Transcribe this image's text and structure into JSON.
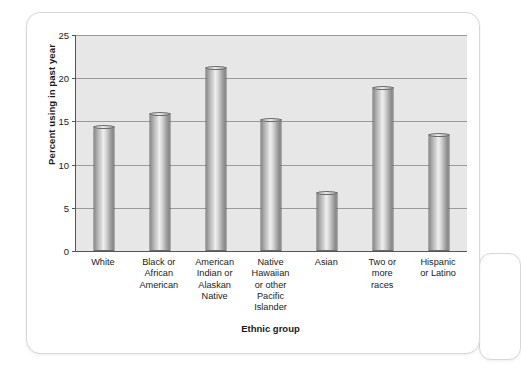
{
  "chart_data": {
    "type": "bar",
    "title": "",
    "xlabel": "Ethnic group",
    "ylabel": "Percent using in past year",
    "categories": [
      "White",
      "Black or African American",
      "American Indian or Alaskan Native",
      "Native Hawaiian or other Pacific Islander",
      "Asian",
      "Two or more races",
      "Hispanic or Latino"
    ],
    "category_lines": [
      [
        "White"
      ],
      [
        "Black or",
        "African",
        "American"
      ],
      [
        "American",
        "Indian or",
        "Alaskan",
        "Native"
      ],
      [
        "Native",
        "Hawaiian",
        "or other",
        "Pacific",
        "Islander"
      ],
      [
        "Asian"
      ],
      [
        "Two or",
        "more",
        "races"
      ],
      [
        "Hispanic",
        "or Latino"
      ]
    ],
    "values": [
      14.5,
      16.0,
      21.3,
      15.3,
      6.8,
      19.0,
      13.5
    ],
    "ylim": [
      0,
      25
    ],
    "yticks": [
      0,
      5,
      10,
      15,
      20,
      25
    ],
    "ytick_labels": [
      "0",
      "5",
      "10",
      "15",
      "20",
      "25"
    ],
    "grid": true,
    "legend": false,
    "legend_position": "none",
    "colors": {
      "bar_fill_light": "#efefef",
      "bar_fill_dark": "#818181",
      "bar_edge": "#6a6a6a",
      "plot_background": "#e7e7e7",
      "gridline": "#9a9a9a",
      "axis": "#555555",
      "text": "#1b1b1b",
      "card_background": "#ffffff",
      "card_border": "#d8d8d8",
      "page_background": "#ffffff"
    }
  }
}
